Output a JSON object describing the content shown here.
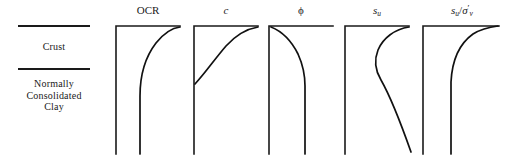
{
  "figure": {
    "width": 516,
    "height": 158,
    "background": "#ffffff",
    "ink_color": "#1a1a1a"
  },
  "strata": {
    "name": "soil-profile-legend",
    "rules": [
      {
        "name": "crust-top-boundary",
        "y": 25
      },
      {
        "name": "crust-base-boundary",
        "y": 68
      }
    ],
    "crust_label": "Crust",
    "nc_clay_label_lines": [
      "Normally",
      "Consolidated",
      "Clay"
    ]
  },
  "panels": [
    {
      "key": "ocr",
      "title_plain": "OCR",
      "title_html": "OCR",
      "x": 112,
      "width": 72
    },
    {
      "key": "cohesion",
      "title_plain": "c",
      "title_html": "<span class=\"ital\">c</span>",
      "x": 190,
      "width": 72
    },
    {
      "key": "phi",
      "title_plain": "φ",
      "title_html": "ϕ",
      "x": 265,
      "width": 72
    },
    {
      "key": "su",
      "title_plain": "su",
      "title_html": "<span class=\"ital\">s</span><sub>u</sub>",
      "x": 341,
      "width": 72
    },
    {
      "key": "su_sigma",
      "title_plain": "su/σ'v",
      "title_html": "<span class=\"ital\">s</span><sub>u</sub>/<span class=\"ital\">σ</span><span class=\"prime\">′</span><sub>v</sub>",
      "x": 419,
      "width": 86
    }
  ],
  "chart_data": {
    "type": "line",
    "xlabel": "",
    "ylabel": "Depth",
    "grid": false,
    "legend": "none",
    "axis_style": "L-shaped: vertical depth axis on left, horizontal property axis along top; depth increases downward",
    "annotations": [
      {
        "text": "Crust",
        "region": "upper stratum"
      },
      {
        "text": "Normally Consolidated Clay",
        "region": "lower stratum"
      }
    ],
    "panels": [
      {
        "name": "OCR",
        "label": "OCR",
        "description": "High OCR at shallow depth in the crust, decreasing rapidly and approaching a constant value of about 1 in the normally consolidated clay.",
        "axis_origin": {
          "x": 4,
          "y": 4
        },
        "axis_bottom_y": 132,
        "axis_right_x": 68,
        "curve": "M 28,132 L 28,74 C 28,52 34,34 44,21 C 52,11 60,6 68,5",
        "points_xy": [
          [
            28,
            132
          ],
          [
            28,
            90
          ],
          [
            28,
            74
          ],
          [
            33,
            56
          ],
          [
            40,
            35
          ],
          [
            50,
            17
          ],
          [
            58,
            9
          ],
          [
            68,
            5
          ]
        ]
      },
      {
        "name": "c",
        "label": "c",
        "description": "Cohesion is low at the base of the crust and increases upward, reaching a maximum at the ground surface; effectively zero trend line in the normally consolidated clay.",
        "axis_origin": {
          "x": 4,
          "y": 4
        },
        "axis_bottom_y": 132,
        "axis_right_x": 68,
        "curve": "M 5,62 C 16,50 24,38 36,24 C 46,13 56,7 68,5",
        "points_xy": [
          [
            5,
            62
          ],
          [
            14,
            52
          ],
          [
            24,
            39
          ],
          [
            36,
            24
          ],
          [
            48,
            13
          ],
          [
            58,
            8
          ],
          [
            68,
            5
          ]
        ]
      },
      {
        "name": "phi",
        "label": "ϕ",
        "description": "Friction angle is highest at the ground surface within the crust, decreasing with depth and then remaining constant through the normally consolidated clay.",
        "axis_origin": {
          "x": 4,
          "y": 4
        },
        "axis_bottom_y": 132,
        "axis_right_x": 68,
        "curve": "M 6,5 C 16,9 26,18 33,32 C 38,43 40,54 40,64 L 40,132",
        "points_xy": [
          [
            6,
            5
          ],
          [
            16,
            9
          ],
          [
            26,
            19
          ],
          [
            33,
            33
          ],
          [
            38,
            48
          ],
          [
            40,
            64
          ],
          [
            40,
            100
          ],
          [
            40,
            132
          ]
        ]
      },
      {
        "name": "su",
        "label": "s_u",
        "description": "Undrained shear strength is relatively high in the crust, decreases to a minimum just below the crust, then increases approximately linearly with depth in the normally consolidated clay.",
        "axis_origin": {
          "x": 4,
          "y": 4
        },
        "axis_bottom_y": 132,
        "axis_right_x": 68,
        "curve": "M 68,5 C 54,7 42,16 37,28 C 33,38 34,48 40,58 C 48,72 58,96 70,130",
        "points_xy": [
          [
            68,
            5
          ],
          [
            56,
            7
          ],
          [
            44,
            14
          ],
          [
            37,
            28
          ],
          [
            34,
            42
          ],
          [
            40,
            58
          ],
          [
            50,
            78
          ],
          [
            60,
            104
          ],
          [
            70,
            130
          ]
        ]
      },
      {
        "name": "su/sigma'v",
        "label": "s_u/σ'_v",
        "description": "Normalized undrained strength ratio is very large near the surface in the crust, falling sharply and becoming essentially constant with depth in the normally consolidated clay.",
        "axis_origin": {
          "x": 4,
          "y": 4
        },
        "axis_bottom_y": 132,
        "axis_right_x": 80,
        "curve": "M 32,132 L 32,60 C 33,40 40,22 54,12 C 62,7 71,5 79,4",
        "points_xy": [
          [
            32,
            132
          ],
          [
            32,
            80
          ],
          [
            32,
            60
          ],
          [
            35,
            44
          ],
          [
            42,
            26
          ],
          [
            54,
            12
          ],
          [
            66,
            6
          ],
          [
            79,
            4
          ]
        ]
      }
    ]
  }
}
